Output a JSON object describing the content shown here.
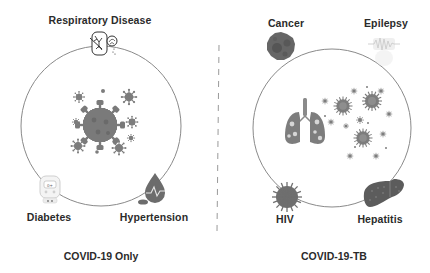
{
  "panels": {
    "left": {
      "caption": "COVID-19 Only",
      "conditions": {
        "top": "Respiratory Disease",
        "bottom_left": "Diabetes",
        "bottom_right": "Hypertension"
      },
      "center_icon": "coronavirus-cluster-icon"
    },
    "right": {
      "caption": "COVID-19-TB",
      "conditions": {
        "top_left": "Cancer",
        "top_right": "Epilepsy",
        "bottom_left": "HIV",
        "bottom_right": "Hepatitis"
      },
      "center_icons": [
        "tb-lungs-icon",
        "coronavirus-cluster-icon"
      ]
    }
  },
  "colors": {
    "circle_stroke": "#8a8a8a",
    "virus": "#7d7d7d",
    "divider": "#9a9a9a",
    "text": "#2b2b2b"
  }
}
